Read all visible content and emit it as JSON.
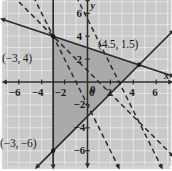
{
  "figure": {
    "type": "coordinate-graph",
    "background_color": "#d3d3d3",
    "plot_background_color": "#c9c9c9",
    "shaded_region_color": "#a6a6a6",
    "line_color": "#2b2b2b",
    "grid_color": "#e8e8e8",
    "axis_name_x": "x",
    "axis_name_y": "y"
  },
  "chart_data": {
    "type": "scatter",
    "title": "",
    "xlabel": "x",
    "ylabel": "y",
    "xlim": [
      -7.4,
      7.4
    ],
    "ylim": [
      -7.4,
      7.4
    ],
    "grid": true,
    "legend": "none",
    "x_ticks": [
      "-6",
      "-4",
      "-2",
      "0",
      "2",
      "4",
      "6"
    ],
    "x_tick_values": [
      -6,
      -4,
      -2,
      0,
      2,
      4,
      6
    ],
    "y_ticks": [
      "6",
      "4",
      "2",
      "0",
      "-2",
      "-4",
      "-6"
    ],
    "y_tick_values": [
      6,
      4,
      2,
      0,
      -2,
      -4,
      -6
    ],
    "annotations": [
      {
        "text": "(−3, 4)",
        "x": -3,
        "y": 4
      },
      {
        "text": "(4.5, 1.5)",
        "x": 4.5,
        "y": 1.5
      },
      {
        "text": "(−3, −6)",
        "x": -3,
        "y": -6
      }
    ],
    "vertices": [
      {
        "x": -3,
        "y": 4
      },
      {
        "x": 4.5,
        "y": 1.5
      },
      {
        "x": -3,
        "y": -6
      }
    ],
    "solid_lines": [
      {
        "name": "vertical-boundary",
        "x_constant": -3,
        "style": "solid"
      },
      {
        "name": "shallow-down-line",
        "slope": -0.3333,
        "intercept": 3.0,
        "style": "solid"
      },
      {
        "name": "rising-line",
        "slope": 1.0,
        "intercept": -3.0,
        "style": "solid"
      }
    ],
    "dashed_lines": [
      {
        "name": "steep-dashed-left",
        "slope": -2.0,
        "intercept": -2.0,
        "style": "dashed"
      },
      {
        "name": "steep-dashed-right",
        "slope": -2.0,
        "intercept": 5.5,
        "style": "dashed"
      },
      {
        "name": "medium-dashed",
        "slope": -1.0,
        "intercept": 1.0,
        "style": "dashed"
      }
    ]
  }
}
